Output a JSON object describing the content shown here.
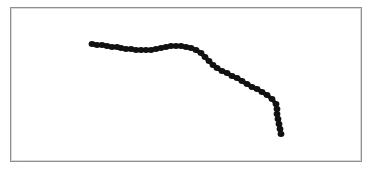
{
  "canvas": {
    "frame_color": "#8f8f8f",
    "background": "#ffffff"
  },
  "stroke": {
    "color": "#111111",
    "dot_radius": 3.4,
    "points": [
      [
        92,
        44
      ],
      [
        97,
        45
      ],
      [
        102,
        45
      ],
      [
        107,
        46
      ],
      [
        112,
        47
      ],
      [
        117,
        47
      ],
      [
        121,
        48
      ],
      [
        126,
        49
      ],
      [
        131,
        49
      ],
      [
        136,
        50
      ],
      [
        141,
        50
      ],
      [
        146,
        50
      ],
      [
        151,
        50
      ],
      [
        156,
        49
      ],
      [
        161,
        48
      ],
      [
        166,
        47
      ],
      [
        171,
        46
      ],
      [
        176,
        46
      ],
      [
        181,
        46
      ],
      [
        186,
        47
      ],
      [
        191,
        48
      ],
      [
        196,
        50
      ],
      [
        201,
        53
      ],
      [
        205,
        57
      ],
      [
        209,
        61
      ],
      [
        213,
        65
      ],
      [
        217,
        68
      ],
      [
        222,
        71
      ],
      [
        227,
        73
      ],
      [
        232,
        76
      ],
      [
        237,
        78
      ],
      [
        242,
        81
      ],
      [
        247,
        84
      ],
      [
        252,
        87
      ],
      [
        257,
        89
      ],
      [
        262,
        92
      ],
      [
        267,
        95
      ],
      [
        272,
        99
      ],
      [
        276,
        104
      ],
      [
        277,
        109
      ],
      [
        277,
        114
      ],
      [
        278,
        119
      ],
      [
        279,
        124
      ],
      [
        280,
        129
      ],
      [
        281,
        134
      ]
    ]
  },
  "caption": {
    "text": "· · ·"
  }
}
